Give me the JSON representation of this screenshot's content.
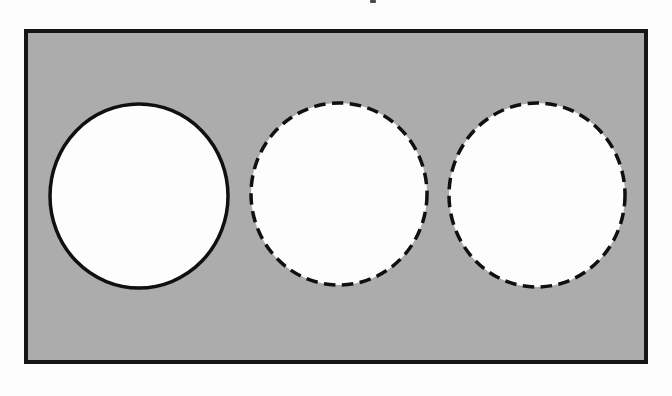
{
  "figure": {
    "canvas": {
      "width": 672,
      "height": 396,
      "background": "#fcfcfc"
    },
    "plate": {
      "x": 26,
      "y": 31,
      "width": 620,
      "height": 331,
      "fill": "#acacac",
      "stroke": "#161616",
      "stroke_width": 4
    },
    "holes": [
      {
        "name": "left-hole-solid",
        "outline": "solid",
        "cx": 139,
        "cy": 196,
        "rx": 89,
        "ry": 92,
        "fill": "#fdfdfd",
        "stroke": "#101010",
        "stroke_width": 3.5
      },
      {
        "name": "middle-hole-dashed",
        "outline": "dashed",
        "cx": 339,
        "cy": 194,
        "rx": 88,
        "ry": 91,
        "fill": "#fdfdfd",
        "stroke": "#101010",
        "stroke_width": 3.5,
        "dash": "11.5 6.5"
      },
      {
        "name": "right-hole-dashed",
        "outline": "dashed",
        "cx": 537,
        "cy": 195,
        "rx": 88,
        "ry": 92,
        "fill": "#fdfdfd",
        "stroke": "#101010",
        "stroke_width": 3.5,
        "dash": "11.5 6.5"
      }
    ],
    "stray_mark": {
      "x": 370,
      "y": 0,
      "width": 6,
      "height": 3,
      "fill": "#4a4a4a",
      "rx": 1
    }
  }
}
